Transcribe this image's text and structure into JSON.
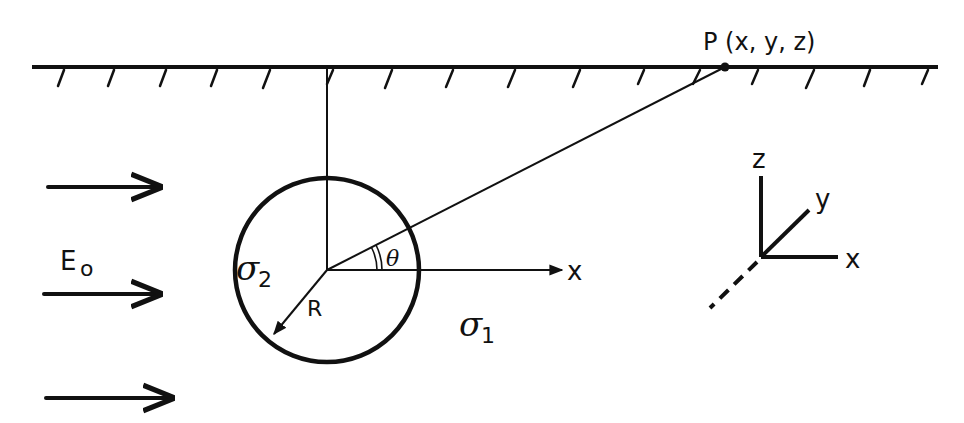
{
  "figure": {
    "point_label": "P (x, y, z)",
    "field_label": "E",
    "field_subscript": "o",
    "sphere_conductivity": "σ",
    "sphere_conductivity_sub": "2",
    "host_conductivity": "σ",
    "host_conductivity_sub": "1",
    "radius_label": "R",
    "angle_label": "θ",
    "x_axis_label": "x",
    "axes": {
      "z": "z",
      "y": "y",
      "x": "x"
    }
  },
  "colors": {
    "ink": "#111111",
    "background": "#ffffff"
  }
}
